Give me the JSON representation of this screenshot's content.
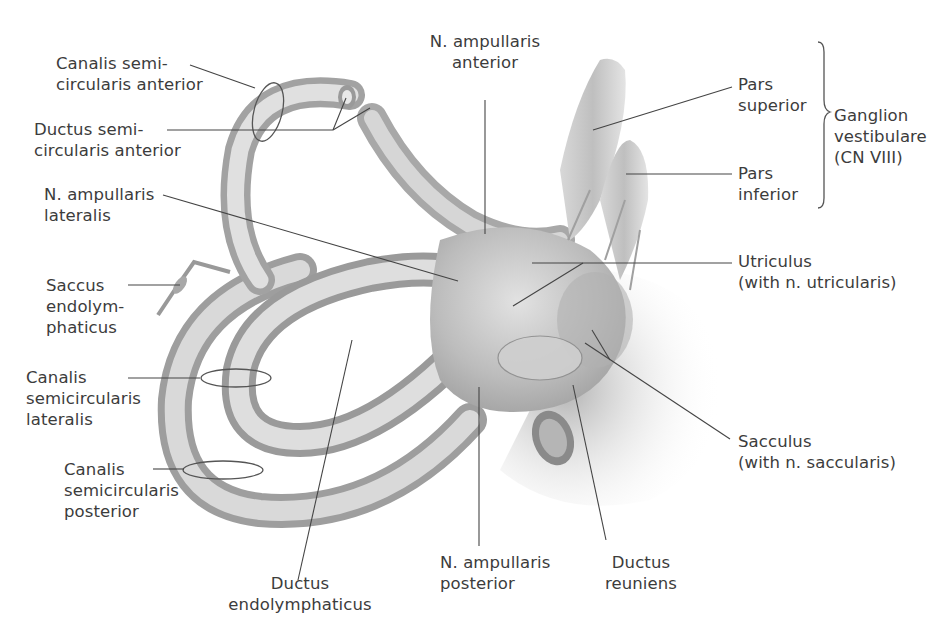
{
  "figure": {
    "text_color": "#3c3c3c",
    "structure_colors": {
      "light": "#e6e6e6",
      "mid": "#bdbdbd",
      "dark": "#8c8c8c",
      "leader": "#444444"
    }
  },
  "labels": {
    "canalis_semicircularis_anterior": {
      "line1": "Canalis semi-",
      "line2": "circularis anterior"
    },
    "ductus_semicircularis_anterior": {
      "line1": "Ductus semi-",
      "line2": "circularis anterior"
    },
    "n_ampullaris_lateralis": {
      "line1": "N. ampullaris",
      "line2": "lateralis"
    },
    "saccus_endolymphaticus": {
      "line1": "Saccus",
      "line2": "endolym-",
      "line3": "phaticus"
    },
    "canalis_semicircularis_lateralis": {
      "line1": "Canalis",
      "line2": "semicircularis",
      "line3": "lateralis"
    },
    "canalis_semicircularis_posterior": {
      "line1": "Canalis",
      "line2": "semicircularis",
      "line3": "posterior"
    },
    "ductus_endolymphaticus": {
      "line1": "Ductus",
      "line2": "endolymphaticus"
    },
    "n_ampullaris_posterior": {
      "line1": "N. ampullaris",
      "line2": "posterior"
    },
    "ductus_reuniens": {
      "line1": "Ductus",
      "line2": "reuniens"
    },
    "n_ampullaris_anterior": {
      "line1": "N. ampullaris",
      "line2": "anterior"
    },
    "pars_superior": {
      "line1": "Pars",
      "line2": "superior"
    },
    "pars_inferior": {
      "line1": "Pars",
      "line2": "inferior"
    },
    "ganglion_vestibulare": {
      "line1": "Ganglion",
      "line2": "vestibulare",
      "line3": "(CN VIII)"
    },
    "utriculus": {
      "line1": "Utriculus",
      "line2": "(with n. utricularis)"
    },
    "sacculus": {
      "line1": "Sacculus",
      "line2": "(with n. saccularis)"
    }
  }
}
